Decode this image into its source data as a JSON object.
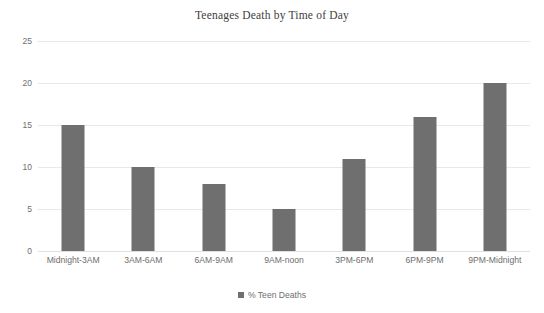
{
  "chart_data": {
    "type": "bar",
    "title": "Teenages Death by Time of Day",
    "xlabel": "",
    "ylabel": "",
    "ylim": [
      0,
      25
    ],
    "yticks": [
      0,
      5,
      10,
      15,
      20,
      25
    ],
    "grid": true,
    "legend_position": "bottom",
    "bar_color": "#6f6f6f",
    "categories": [
      "Midnight-3AM",
      "3AM-6AM",
      "6AM-9AM",
      "9AM-noon",
      "3PM-6PM",
      "6PM-9PM",
      "9PM-Midnight"
    ],
    "series": [
      {
        "name": "% Teen Deaths",
        "values": [
          15,
          10,
          8,
          5,
          11,
          16,
          20
        ]
      }
    ]
  },
  "legend": {
    "entries": [
      {
        "label": "% Teen Deaths",
        "color": "#6f6f6f",
        "marker": "square-marker"
      }
    ]
  }
}
